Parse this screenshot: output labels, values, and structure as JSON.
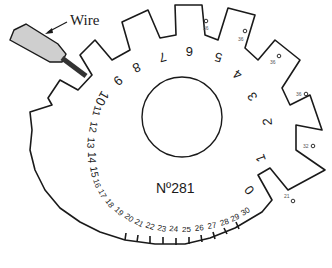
{
  "diagram": {
    "callout": {
      "label": "Wire"
    },
    "model_number": "Nº281",
    "gauge_numbers": {
      "large": [
        "0",
        "1",
        "2",
        "3",
        "4",
        "5",
        "6",
        "7",
        "8",
        "9",
        "10"
      ],
      "small": [
        "11",
        "12",
        "13",
        "14",
        "15",
        "16",
        "17",
        "18",
        "19",
        "20",
        "21",
        "22",
        "23",
        "24",
        "25",
        "26",
        "27",
        "28",
        "29",
        "30"
      ]
    },
    "tab_marks": [
      "36",
      "36",
      "36",
      "36",
      "32",
      "21"
    ],
    "colors": {
      "line": "#1a1a1a",
      "wire_holder": "#cfcfcf",
      "wire": "#333333"
    }
  }
}
